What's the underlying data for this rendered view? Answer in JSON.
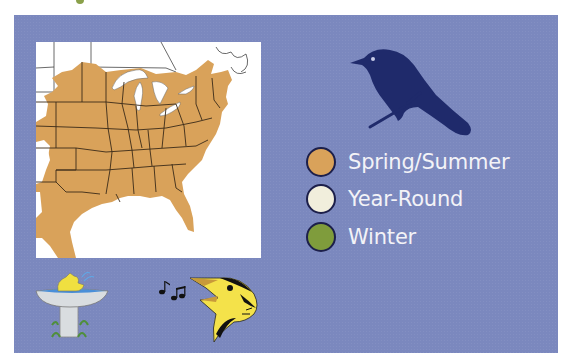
{
  "panel": {
    "background_color": "#7b88be"
  },
  "range_map": {
    "description": "Range map of eastern United States",
    "range_color": "#d9a25a",
    "water_color": "#ffffff"
  },
  "icons": {
    "bird_silhouette": "perched-bird-silhouette-icon",
    "birdbath": "birdbath-icon",
    "music_notes": "music-notes-icon",
    "singing_bird": "singing-bird-head-icon"
  },
  "legend": {
    "items": [
      {
        "label": "Spring/Summer",
        "color": "#d9a25a"
      },
      {
        "label": "Year-Round",
        "color": "#f1eedc"
      },
      {
        "label": "Winter",
        "color": "#7f9c3c"
      }
    ]
  }
}
